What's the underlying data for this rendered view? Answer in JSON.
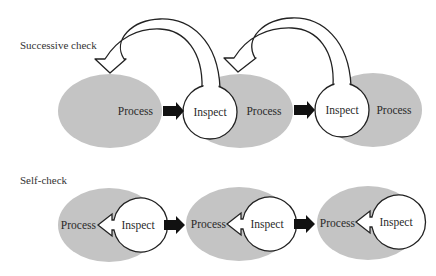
{
  "diagram": {
    "colors": {
      "process_fill": "#c4c4c4",
      "inspect_fill": "#ffffff",
      "outline": "#222222",
      "flow_arrow": "#111111"
    },
    "sections": [
      {
        "title": "Successive check",
        "units": [
          {
            "process_label": "Process",
            "inspect_label": "Inspect"
          },
          {
            "process_label": "Process",
            "inspect_label": "Inspect"
          },
          {
            "process_label": "Process"
          }
        ],
        "feedback": "Each Inspect feeds back (hollow curved arrow) to the previous Process"
      },
      {
        "title": "Self-check",
        "units": [
          {
            "process_label": "Process",
            "inspect_label": "Inspect"
          },
          {
            "process_label": "Process",
            "inspect_label": "Inspect"
          },
          {
            "process_label": "Process",
            "inspect_label": "Inspect"
          }
        ],
        "feedback": "Each Inspect feeds back (hollow arrow) to its own Process"
      }
    ]
  }
}
